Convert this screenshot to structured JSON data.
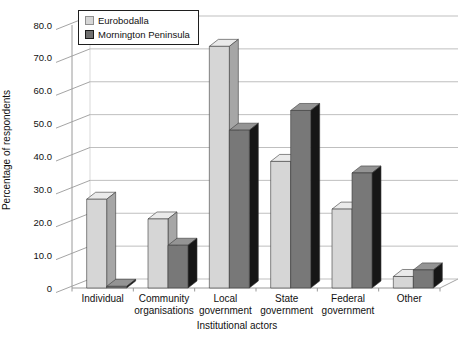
{
  "chart_data": {
    "type": "bar",
    "style": "3d-column",
    "categories": [
      "Individual",
      "Community organisations",
      "Local government",
      "State government",
      "Federal government",
      "Other"
    ],
    "category_label_lines": [
      [
        "Individual"
      ],
      [
        "Community",
        "organisations"
      ],
      [
        "Local",
        "government"
      ],
      [
        "State",
        "government"
      ],
      [
        "Federal",
        "government"
      ],
      [
        "Other"
      ]
    ],
    "series": [
      {
        "name": "Eurobodalla",
        "values": [
          27,
          21,
          73.5,
          38.5,
          24,
          3.5
        ],
        "color_front": "#d6d6d6",
        "color_top": "#eaeaea",
        "color_side": "#a6a6a6"
      },
      {
        "name": "Mornington Peninsula",
        "values": [
          0.5,
          13,
          48,
          54,
          35,
          5.5
        ],
        "color_front": "#787878",
        "color_top": "#949494",
        "color_side": "#161616"
      }
    ],
    "title": "",
    "xlabel": "Institutional actors",
    "ylabel": "Percentage of respondents",
    "ylim": [
      0,
      80
    ],
    "ytick_step": 10,
    "ytick_labels": [
      "0",
      "10.0",
      "20.0",
      "30.0",
      "40.0",
      "50.0",
      "60.0",
      "70.0",
      "80.0"
    ],
    "grid": true,
    "legend_position": "top-left",
    "line_color": "#9a9a9a",
    "outline_color": "#3a3a3a"
  }
}
